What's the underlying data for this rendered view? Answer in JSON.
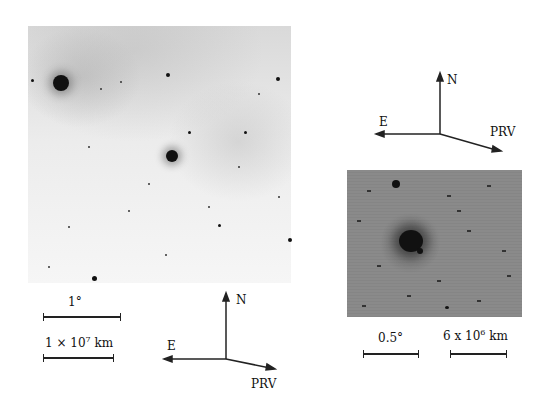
{
  "left_panel": {
    "description": "Wide-field comet image, inverted grayscale",
    "scale_bars": [
      {
        "label": "1°"
      },
      {
        "label_prefix": "1 × 10",
        "exponent": "7",
        "unit": " km"
      }
    ],
    "compass": {
      "north": "N",
      "east": "E",
      "prv": "PRV"
    }
  },
  "right_panel": {
    "description": "Close-up comet image, grayscale",
    "compass": {
      "north": "N",
      "east": "E",
      "prv": "PRV"
    },
    "scale_bars": [
      {
        "label": "0.5°"
      },
      {
        "label_prefix": "6 x 10",
        "exponent": "6",
        "unit": " km"
      }
    ]
  }
}
